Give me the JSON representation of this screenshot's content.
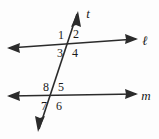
{
  "figure": {
    "type": "geometry-diagram",
    "background_color": "#fdfdfd",
    "stroke_color": "#2b2b2b",
    "text_color": "#1a1a1a"
  },
  "lines": {
    "transversal": {
      "label": "t",
      "label_x": 88,
      "label_y": 17,
      "x1": 39,
      "y1": 129,
      "x2": 77,
      "y2": 14,
      "arrow_start": true,
      "arrow_end": true
    },
    "upper": {
      "label": "ℓ",
      "label_x": 143,
      "label_y": 44,
      "x1": 9,
      "y1": 48,
      "x2": 136,
      "y2": 39,
      "arrow_start": true,
      "arrow_end": true
    },
    "lower": {
      "label": "m",
      "label_x": 141,
      "label_y": 100,
      "x1": 9,
      "y1": 96,
      "x2": 136,
      "y2": 94,
      "arrow_start": true,
      "arrow_end": true
    }
  },
  "intersections": {
    "upper": {
      "x": 71,
      "y": 43
    },
    "lower": {
      "x": 55,
      "y": 95
    }
  },
  "angles": [
    {
      "id": "angle-1",
      "label": "1",
      "x": 61,
      "y": 39,
      "position": "upper-left-above"
    },
    {
      "id": "angle-2",
      "label": "2",
      "x": 74,
      "y": 38,
      "position": "upper-right-above"
    },
    {
      "id": "angle-3",
      "label": "3",
      "x": 59,
      "y": 56,
      "position": "upper-left-below"
    },
    {
      "id": "angle-4",
      "label": "4",
      "x": 73,
      "y": 56,
      "position": "upper-right-below"
    },
    {
      "id": "angle-8",
      "label": "8",
      "x": 45,
      "y": 91,
      "position": "lower-left-above"
    },
    {
      "id": "angle-5",
      "label": "5",
      "x": 59,
      "y": 91,
      "position": "lower-right-above"
    },
    {
      "id": "angle-7",
      "label": "7",
      "x": 42,
      "y": 108,
      "position": "lower-left-below"
    },
    {
      "id": "angle-6",
      "label": "6",
      "x": 57,
      "y": 108,
      "position": "lower-right-below"
    }
  ]
}
